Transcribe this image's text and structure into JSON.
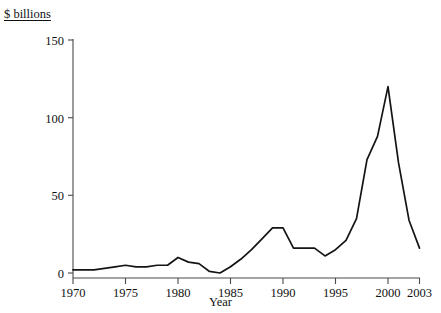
{
  "chart_data": {
    "type": "line",
    "title": "",
    "subtitle": "",
    "ylabel": "$ billions",
    "xlabel": "Year",
    "grid": false,
    "legend": false,
    "xlim": [
      1970,
      2003
    ],
    "ylim": [
      0,
      150
    ],
    "yticks": [
      0,
      50,
      100,
      150
    ],
    "ytick_labels": [
      "0",
      "50",
      "100",
      "150"
    ],
    "xticks": [
      1970,
      1975,
      1980,
      1985,
      1990,
      1995,
      2000,
      2003
    ],
    "xtick_labels": [
      "1970",
      "1975",
      "1980",
      "1985",
      "1990",
      "1995",
      "2000",
      "2003"
    ],
    "x": [
      1970,
      1971,
      1972,
      1973,
      1974,
      1975,
      1976,
      1977,
      1978,
      1979,
      1980,
      1981,
      1982,
      1983,
      1984,
      1985,
      1986,
      1987,
      1988,
      1989,
      1990,
      1991,
      1992,
      1993,
      1994,
      1995,
      1996,
      1997,
      1998,
      1999,
      2000,
      2001,
      2002,
      2003
    ],
    "series": [
      {
        "name": "$ billions",
        "values": [
          2,
          2,
          2,
          3,
          4,
          5,
          4,
          4,
          5,
          5,
          10,
          7,
          6,
          1,
          0,
          4,
          9,
          15,
          22,
          29,
          29,
          16,
          16,
          16,
          11,
          15,
          21,
          35,
          73,
          88,
          120,
          71,
          34,
          16
        ]
      }
    ]
  }
}
